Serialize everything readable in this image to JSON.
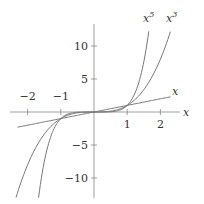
{
  "chart_data": {
    "type": "line",
    "title": "",
    "xlabel": "x",
    "ylabel": "",
    "xlim": [
      -2.5,
      2.5
    ],
    "ylim": [
      -13,
      13
    ],
    "x_ticks": [
      -2,
      -1,
      1,
      2
    ],
    "x_tick_labels": [
      "−2",
      "−1",
      "1",
      "2"
    ],
    "y_ticks": [
      10,
      5,
      -5,
      -10
    ],
    "y_tick_labels": [
      "10",
      "5",
      "−5",
      "−10"
    ],
    "grid": false,
    "legend": "none (curves labeled inline)",
    "series": [
      {
        "name": "x",
        "label": "x",
        "function": "y = x",
        "x_range": [
          -2.3,
          2.3
        ]
      },
      {
        "name": "x^3",
        "label": "x³",
        "function": "y = x^3",
        "x_range": [
          -2.35,
          2.3
        ]
      },
      {
        "name": "x^5",
        "label": "x⁵",
        "function": "y = x^5",
        "x_range": [
          -1.67,
          1.65
        ]
      }
    ],
    "annotations": [
      "x",
      "x^5",
      "x^3"
    ]
  }
}
